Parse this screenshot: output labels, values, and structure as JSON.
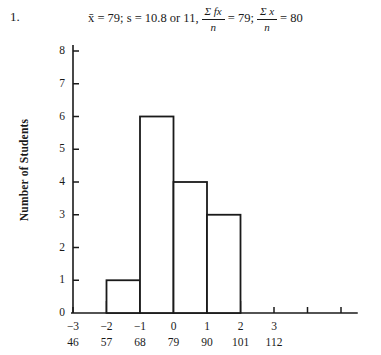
{
  "item": {
    "number": "1."
  },
  "answer": {
    "mean_part": "x̄ = 79; s = 10.8 or 11,",
    "frac1": {
      "numerator": "Σ fx",
      "denominator": "n",
      "equals": "= 79;"
    },
    "frac2": {
      "numerator": "Σ x",
      "denominator": "n",
      "equals": "= 80"
    },
    "full_text": "x̄ = 79; s = 10.8 or 11, Σfx/n = 79; Σx/n = 80"
  },
  "chart_data": {
    "type": "bar",
    "title": "",
    "xlabel": "",
    "ylabel": "Number of Students",
    "categories": [
      "-2 to -1",
      "-1 to 0",
      "0 to 1",
      "1 to 2"
    ],
    "values": [
      1,
      6,
      4,
      3
    ],
    "bins": [
      {
        "z_start": -2,
        "z_end": -1,
        "raw_start": 57,
        "raw_end": 68,
        "count": 1
      },
      {
        "z_start": -1,
        "z_end": 0,
        "raw_start": 68,
        "raw_end": 79,
        "count": 6
      },
      {
        "z_start": 0,
        "z_end": 1,
        "raw_start": 79,
        "raw_end": 90,
        "count": 4
      },
      {
        "z_start": 1,
        "z_end": 2,
        "raw_start": 90,
        "raw_end": 101,
        "count": 3
      }
    ],
    "ylim": [
      0,
      8
    ],
    "yticks": [
      0,
      1,
      2,
      3,
      4,
      5,
      6,
      7,
      8
    ],
    "ytick_labels": [
      "0",
      "1",
      "2",
      "3",
      "4",
      "5",
      "6",
      "7",
      "8"
    ],
    "xlim": [
      -3.5,
      5.5
    ],
    "xticks_z": [
      -3,
      -2,
      -1,
      0,
      1,
      2,
      3
    ],
    "xtick_labels_z": [
      "−3",
      "−2",
      "−1",
      "0",
      "1",
      "2",
      "3"
    ],
    "xtick_labels_raw": [
      "46",
      "57",
      "68",
      "79",
      "90",
      "101",
      "112"
    ],
    "extra_unlabeled_ticks_z": [
      4,
      5
    ],
    "grid": false,
    "legend": null,
    "bar_fill": "#ffffff",
    "bar_stroke": "#1a1a1a",
    "axis_color": "#1a1a1a"
  }
}
